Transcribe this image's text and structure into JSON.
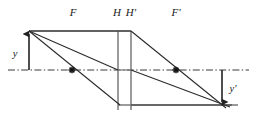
{
  "diagram": {
    "colors": {
      "ray": "#2b2b2b",
      "construction": "#6e6e6e",
      "axis": "#3a3a3a",
      "text": "#1a1a1a",
      "background": "#ffffff"
    },
    "labels": {
      "front_focal_point": "F",
      "principal_plane_object": "H",
      "principal_plane_image": "H'",
      "back_focal_point": "F'",
      "object_height": "y",
      "image_height": "y'"
    },
    "label_positions": {
      "front_focal_point": {
        "x": 73,
        "y": 16
      },
      "principal_plane_object": {
        "x": 117,
        "y": 16
      },
      "principal_plane_image": {
        "x": 131,
        "y": 16
      },
      "back_focal_point": {
        "x": 176,
        "y": 16
      },
      "object_height": {
        "x": 15,
        "y": 57
      },
      "image_height": {
        "x": 231,
        "y": 92
      }
    },
    "geometry": {
      "optical_axis": {
        "y": 70,
        "x_start": 8,
        "x_end": 249
      },
      "object_plane_x": 29,
      "object_tip_y": 31,
      "image_plane_x": 222,
      "image_tip_y": 105,
      "principal_plane_H_x": 118,
      "principal_plane_Hp_x": 131,
      "principal_plane_top_y": 31,
      "principal_plane_bottom_y": 110,
      "focal_point_F": {
        "x": 72,
        "y": 70
      },
      "focal_point_Fp": {
        "x": 176,
        "y": 70
      },
      "lower_rail_y": 105,
      "lower_rail_x_start": 118,
      "lower_rail_x_end": 238
    }
  }
}
